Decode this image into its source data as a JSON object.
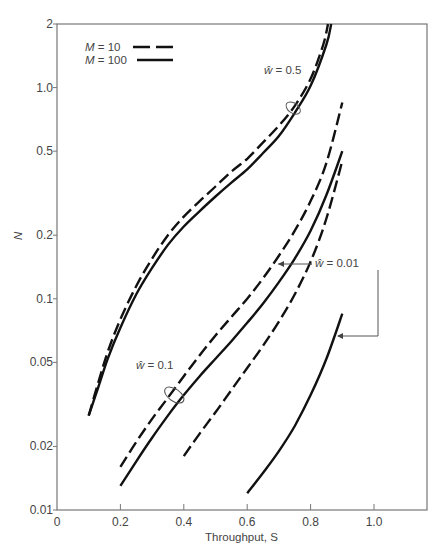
{
  "chart_data": {
    "type": "line",
    "title": "",
    "xlabel": "Throughput, S",
    "ylabel": "N",
    "xlim": [
      0,
      1.17
    ],
    "ylim": [
      0.01,
      2
    ],
    "yscale": "log",
    "grid": false,
    "x_ticks": [
      0,
      0.2,
      0.4,
      0.6,
      0.8,
      1.0
    ],
    "x_tick_labels": [
      "0",
      "0.2",
      "0.4",
      "0.6",
      "0.8",
      "1.0"
    ],
    "y_ticks": [
      0.01,
      0.02,
      0.05,
      0.1,
      0.2,
      0.5,
      1.0,
      2
    ],
    "y_tick_labels": [
      "0.01",
      "0.02",
      "0.05",
      "0.1",
      "0.2",
      "0.5",
      "1.0",
      "2"
    ],
    "legend": {
      "position": "upper left",
      "entries": [
        {
          "label_var": "M",
          "label_eq": "=",
          "label_val": "10",
          "style": "dashed"
        },
        {
          "label_var": "M",
          "label_eq": "=",
          "label_val": "100",
          "style": "solid"
        }
      ]
    },
    "annotations": [
      {
        "var": "ŵ",
        "text": "= 0.5",
        "x": 0.6,
        "y": 1.25
      },
      {
        "var": "ŵ",
        "text": "= 0.1",
        "x": 0.25,
        "y": 0.045
      },
      {
        "var": "ŵ",
        "text": "= 0.01",
        "x": 0.85,
        "y": 0.155
      }
    ],
    "series": [
      {
        "name": "w=0.5, M=10",
        "w": 0.5,
        "M": 10,
        "style": "dashed",
        "x": [
          0.1,
          0.13,
          0.16,
          0.2,
          0.25,
          0.3,
          0.35,
          0.4,
          0.45,
          0.5,
          0.55,
          0.6,
          0.65,
          0.7,
          0.75,
          0.8,
          0.84,
          0.855
        ],
        "y": [
          0.028,
          0.04,
          0.056,
          0.08,
          0.115,
          0.155,
          0.2,
          0.245,
          0.29,
          0.34,
          0.4,
          0.46,
          0.55,
          0.66,
          0.82,
          1.1,
          1.6,
          2.0
        ]
      },
      {
        "name": "w=0.5, M=100",
        "w": 0.5,
        "M": 100,
        "style": "solid",
        "x": [
          0.1,
          0.13,
          0.16,
          0.2,
          0.25,
          0.3,
          0.35,
          0.4,
          0.45,
          0.5,
          0.55,
          0.6,
          0.65,
          0.7,
          0.75,
          0.8,
          0.85,
          0.865
        ],
        "y": [
          0.028,
          0.038,
          0.052,
          0.073,
          0.105,
          0.14,
          0.18,
          0.22,
          0.26,
          0.305,
          0.355,
          0.41,
          0.49,
          0.59,
          0.76,
          1.02,
          1.6,
          2.0
        ]
      },
      {
        "name": "w=0.1, M=10",
        "w": 0.1,
        "M": 10,
        "style": "dashed",
        "x": [
          0.2,
          0.25,
          0.3,
          0.35,
          0.4,
          0.45,
          0.5,
          0.55,
          0.6,
          0.65,
          0.7,
          0.75,
          0.8,
          0.85,
          0.9
        ],
        "y": [
          0.016,
          0.021,
          0.027,
          0.034,
          0.043,
          0.054,
          0.067,
          0.082,
          0.1,
          0.125,
          0.16,
          0.21,
          0.29,
          0.44,
          0.85
        ]
      },
      {
        "name": "w=0.1, M=100",
        "w": 0.1,
        "M": 100,
        "style": "solid",
        "x": [
          0.2,
          0.25,
          0.3,
          0.35,
          0.4,
          0.45,
          0.5,
          0.55,
          0.6,
          0.65,
          0.7,
          0.75,
          0.8,
          0.85,
          0.9
        ],
        "y": [
          0.013,
          0.017,
          0.022,
          0.028,
          0.035,
          0.043,
          0.052,
          0.063,
          0.077,
          0.095,
          0.12,
          0.155,
          0.21,
          0.31,
          0.5
        ]
      },
      {
        "name": "w=0.01, M=10",
        "w": 0.01,
        "M": 10,
        "style": "dashed",
        "x": [
          0.4,
          0.45,
          0.5,
          0.55,
          0.6,
          0.65,
          0.7,
          0.75,
          0.8,
          0.85,
          0.9
        ],
        "y": [
          0.018,
          0.023,
          0.029,
          0.037,
          0.047,
          0.06,
          0.078,
          0.105,
          0.15,
          0.24,
          0.45
        ]
      },
      {
        "name": "w=0.01, M=100",
        "w": 0.01,
        "M": 100,
        "style": "solid",
        "x": [
          0.6,
          0.65,
          0.7,
          0.75,
          0.8,
          0.85,
          0.9
        ],
        "y": [
          0.012,
          0.015,
          0.019,
          0.025,
          0.035,
          0.052,
          0.085
        ]
      }
    ]
  }
}
